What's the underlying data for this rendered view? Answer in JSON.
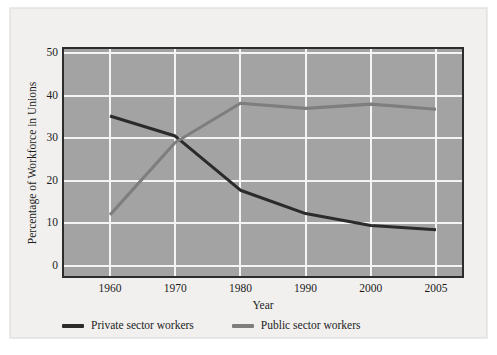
{
  "chart_data": {
    "type": "line",
    "title": "",
    "xlabel": "Year",
    "ylabel": "Percentage of Workforce in Unions",
    "categories": [
      "1960",
      "1970",
      "1980",
      "1990",
      "2000",
      "2005"
    ],
    "ylim": [
      0,
      50
    ],
    "yticks": [
      0,
      10,
      20,
      30,
      40,
      50
    ],
    "grid": true,
    "legend_position": "bottom-left",
    "series": [
      {
        "name": "Private sector workers",
        "color": "#2b2b2b",
        "values": [
          35.2,
          30.5,
          17.8,
          12.3,
          9.5,
          8.5
        ]
      },
      {
        "name": "Public sector workers",
        "color": "#7e7e7e",
        "values": [
          12.0,
          29.0,
          38.2,
          37.0,
          38.0,
          36.8
        ]
      }
    ]
  },
  "legend": {
    "items": [
      {
        "label": "Private sector workers",
        "color": "#2b2b2b",
        "swatch": "line-swatch-dark"
      },
      {
        "label": "Public sector workers",
        "color": "#7e7e7e",
        "swatch": "line-swatch-gray"
      }
    ]
  },
  "style": {
    "plot_background": "#a3a3a3",
    "page_background": "#f1f0ee",
    "gridline_color": "#f4f4f4",
    "axis_color": "#2c2c2c",
    "text_color": "#1c1c1c"
  }
}
